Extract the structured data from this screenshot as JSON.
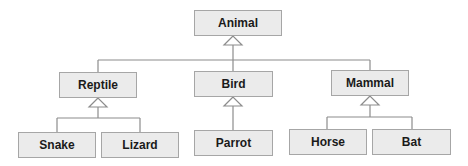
{
  "diagram": {
    "type": "class-hierarchy",
    "colors": {
      "box_fill": "#ebebeb",
      "box_border": "#a6a6a6",
      "line": "#8c8c8c",
      "text": "#1a1a1a"
    },
    "nodes": {
      "animal": {
        "label": "Animal",
        "x": 194,
        "y": 10,
        "w": 88,
        "h": 26
      },
      "reptile": {
        "label": "Reptile",
        "x": 59,
        "y": 72,
        "w": 78,
        "h": 26
      },
      "bird": {
        "label": "Bird",
        "x": 194,
        "y": 71,
        "w": 79,
        "h": 26
      },
      "mammal": {
        "label": "Mammal",
        "x": 331,
        "y": 70,
        "w": 78,
        "h": 26
      },
      "snake": {
        "label": "Snake",
        "x": 18,
        "y": 132,
        "w": 78,
        "h": 26
      },
      "lizard": {
        "label": "Lizard",
        "x": 101,
        "y": 132,
        "w": 78,
        "h": 26
      },
      "parrot": {
        "label": "Parrot",
        "x": 194,
        "y": 130,
        "w": 79,
        "h": 26
      },
      "horse": {
        "label": "Horse",
        "x": 289,
        "y": 129,
        "w": 78,
        "h": 26
      },
      "bat": {
        "label": "Bat",
        "x": 372,
        "y": 129,
        "w": 79,
        "h": 26
      }
    },
    "edges": [
      {
        "from": "reptile",
        "to": "animal",
        "kind": "inheritance"
      },
      {
        "from": "bird",
        "to": "animal",
        "kind": "inheritance"
      },
      {
        "from": "mammal",
        "to": "animal",
        "kind": "inheritance"
      },
      {
        "from": "snake",
        "to": "reptile",
        "kind": "inheritance"
      },
      {
        "from": "lizard",
        "to": "reptile",
        "kind": "inheritance"
      },
      {
        "from": "parrot",
        "to": "bird",
        "kind": "inheritance"
      },
      {
        "from": "horse",
        "to": "mammal",
        "kind": "inheritance"
      },
      {
        "from": "bat",
        "to": "mammal",
        "kind": "inheritance"
      }
    ]
  }
}
